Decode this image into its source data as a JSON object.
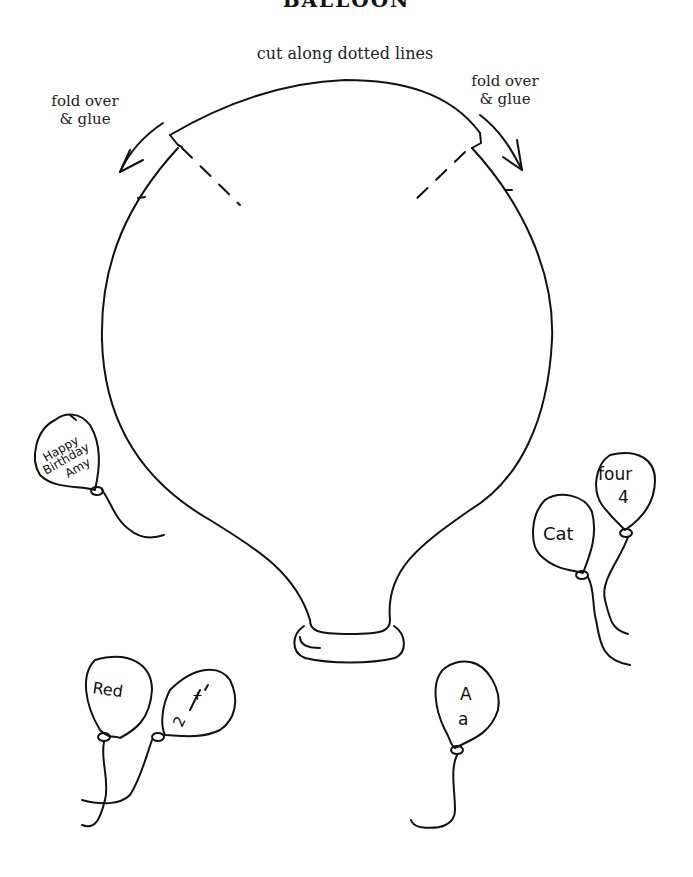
{
  "page": {
    "title_partial": "BALLOON",
    "instructions": {
      "cut": "cut along dotted lines",
      "fold_left_line1": "fold over",
      "fold_left_line2": "& glue",
      "fold_right_line1": "fold over",
      "fold_right_line2": "& glue"
    }
  },
  "small_balloons": [
    {
      "id": "birthday",
      "lines": [
        "Happy",
        "Birthday",
        "Amy"
      ]
    },
    {
      "id": "cat",
      "lines": [
        "Cat"
      ]
    },
    {
      "id": "four",
      "lines": [
        "four",
        "4"
      ]
    },
    {
      "id": "red",
      "lines": [
        "Red"
      ]
    },
    {
      "id": "fraction",
      "lines": [
        "+",
        "2",
        "—",
        "1"
      ]
    },
    {
      "id": "letter",
      "lines": [
        "A",
        "a"
      ]
    }
  ],
  "colors": {
    "ink": "#111111",
    "background": "#ffffff"
  }
}
